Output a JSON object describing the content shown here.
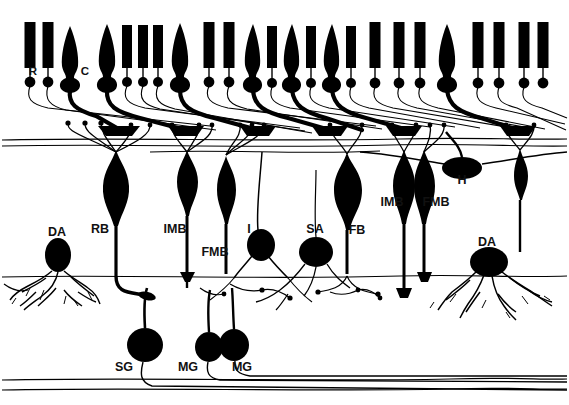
{
  "figure": {
    "background_color": "#ffffff",
    "ink_color": "#000000",
    "width": 569,
    "height": 405
  },
  "labels": {
    "rod": "R",
    "cone": "C",
    "horizontal": "H",
    "diffuse_amacrine_left": "DA",
    "rod_bipolar": "RB",
    "invaginating_midget_bipolar_left": "IMB",
    "flat_midget_bipolar_left": "FMB",
    "interplexiform": "I",
    "stratified_amacrine": "SA",
    "flat_bipolar": "FB",
    "invaginating_midget_bipolar_right": "IMB",
    "flat_midget_bipolar_right": "FMB",
    "diffuse_amacrine_right": "DA",
    "small_ganglion": "SG",
    "midget_ganglion_left": "MG",
    "midget_ganglion_right": "MG"
  },
  "label_positions": [
    {
      "key": "rod",
      "text": "R",
      "x": 33,
      "y": 75
    },
    {
      "key": "cone",
      "text": "C",
      "x": 85,
      "y": 75
    },
    {
      "key": "horizontal",
      "text": "H",
      "x": 462,
      "y": 184
    },
    {
      "key": "da_left",
      "text": "DA",
      "x": 49,
      "y": 236
    },
    {
      "key": "rb",
      "text": "RB",
      "x": 100,
      "y": 233
    },
    {
      "key": "imb_left",
      "text": "IMB",
      "x": 170,
      "y": 233
    },
    {
      "key": "fmb_left",
      "text": "FMB",
      "x": 213,
      "y": 256
    },
    {
      "key": "i",
      "text": "I",
      "x": 249,
      "y": 233
    },
    {
      "key": "sa",
      "text": "SA",
      "x": 312,
      "y": 233
    },
    {
      "key": "fb",
      "text": "FB",
      "x": 356,
      "y": 234
    },
    {
      "key": "imb_right",
      "text": "IMB",
      "x": 391,
      "y": 206
    },
    {
      "key": "fmb_right",
      "text": "FMB",
      "x": 433,
      "y": 206
    },
    {
      "key": "da_right",
      "text": "DA",
      "x": 487,
      "y": 246
    },
    {
      "key": "sg",
      "text": "SG",
      "x": 122,
      "y": 371
    },
    {
      "key": "mg_left",
      "text": "MG",
      "x": 186,
      "y": 371
    },
    {
      "key": "mg_right",
      "text": "MG",
      "x": 240,
      "y": 371
    }
  ],
  "photoreceptors": [
    {
      "type": "rod",
      "x": 30,
      "top": 22,
      "bottom": 68,
      "width": 11
    },
    {
      "type": "rod",
      "x": 48,
      "top": 22,
      "bottom": 68,
      "width": 11
    },
    {
      "type": "cone",
      "x": 70,
      "top": 26,
      "bottom": 70,
      "width": 17
    },
    {
      "type": "cone",
      "x": 107,
      "top": 24,
      "bottom": 70,
      "width": 17
    },
    {
      "type": "rod",
      "x": 127,
      "top": 25,
      "bottom": 68,
      "width": 10
    },
    {
      "type": "rod",
      "x": 143,
      "top": 25,
      "bottom": 68,
      "width": 10
    },
    {
      "type": "rod",
      "x": 158,
      "top": 25,
      "bottom": 68,
      "width": 10
    },
    {
      "type": "cone",
      "x": 180,
      "top": 23,
      "bottom": 70,
      "width": 17
    },
    {
      "type": "rod",
      "x": 209,
      "top": 22,
      "bottom": 68,
      "width": 11
    },
    {
      "type": "rod",
      "x": 229,
      "top": 22,
      "bottom": 68,
      "width": 11
    },
    {
      "type": "cone",
      "x": 253,
      "top": 24,
      "bottom": 70,
      "width": 16
    },
    {
      "type": "rod",
      "x": 272,
      "top": 26,
      "bottom": 68,
      "width": 10
    },
    {
      "type": "cone",
      "x": 292,
      "top": 24,
      "bottom": 70,
      "width": 16
    },
    {
      "type": "rod",
      "x": 311,
      "top": 26,
      "bottom": 68,
      "width": 10
    },
    {
      "type": "cone",
      "x": 332,
      "top": 24,
      "bottom": 70,
      "width": 16
    },
    {
      "type": "rod",
      "x": 351,
      "top": 26,
      "bottom": 68,
      "width": 10
    },
    {
      "type": "rod",
      "x": 375,
      "top": 22,
      "bottom": 68,
      "width": 11
    },
    {
      "type": "rod",
      "x": 399,
      "top": 22,
      "bottom": 68,
      "width": 11
    },
    {
      "type": "rod",
      "x": 420,
      "top": 22,
      "bottom": 68,
      "width": 11
    },
    {
      "type": "cone",
      "x": 447,
      "top": 24,
      "bottom": 70,
      "width": 17
    },
    {
      "type": "rod",
      "x": 478,
      "top": 22,
      "bottom": 68,
      "width": 11
    },
    {
      "type": "rod",
      "x": 499,
      "top": 22,
      "bottom": 68,
      "width": 11
    },
    {
      "type": "rod",
      "x": 524,
      "top": 22,
      "bottom": 68,
      "width": 11
    },
    {
      "type": "rod",
      "x": 543,
      "top": 22,
      "bottom": 68,
      "width": 11
    }
  ],
  "layers": {
    "opl_y": 139,
    "ipl_y": 276,
    "nerve_fiber_y": 386
  },
  "cells": {
    "bipolars": [
      {
        "key": "rb",
        "x": 116,
        "soma_y": 188,
        "rw": 14,
        "rh": 22
      },
      {
        "key": "imb_left",
        "x": 187,
        "soma_y": 182,
        "rw": 12,
        "rh": 21
      },
      {
        "key": "fmb_left",
        "x": 226,
        "soma_y": 196,
        "rw": 12,
        "rh": 20
      },
      {
        "key": "fb",
        "x": 347,
        "soma_y": 198,
        "rw": 14,
        "rh": 21
      },
      {
        "key": "imb_right",
        "x": 404,
        "soma_y": 190,
        "rw": 12,
        "rh": 22
      },
      {
        "key": "fmb_right",
        "x": 424,
        "soma_y": 190,
        "rw": 12,
        "rh": 22
      }
    ],
    "amacrines": [
      {
        "key": "da_left",
        "x": 58,
        "soma_y": 255,
        "rw": 13,
        "rh": 17
      },
      {
        "key": "sa",
        "x": 316,
        "soma_y": 252,
        "rw": 17,
        "rh": 15
      },
      {
        "key": "da_right",
        "x": 489,
        "soma_y": 262,
        "rw": 19,
        "rh": 15
      }
    ],
    "interplexiform": {
      "key": "i",
      "x": 261,
      "soma_y": 245,
      "rw": 14,
      "rh": 16
    },
    "horizontal": {
      "key": "h",
      "x": 462,
      "soma_y": 168,
      "rw": 20,
      "rh": 11
    },
    "ganglions": [
      {
        "key": "sg",
        "x": 145,
        "soma_y": 345,
        "rw": 18,
        "rh": 17
      },
      {
        "key": "mg_left",
        "x": 209,
        "soma_y": 347,
        "rw": 14,
        "rh": 15
      },
      {
        "key": "mg_right",
        "x": 234,
        "soma_y": 345,
        "rw": 15,
        "rh": 16
      }
    ]
  }
}
